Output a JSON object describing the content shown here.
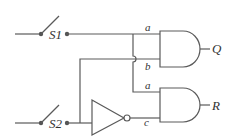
{
  "diagram": {
    "type": "logic-circuit",
    "switches": [
      {
        "id": "S1",
        "label": "S1"
      },
      {
        "id": "S2",
        "label": "S2"
      }
    ],
    "gates": [
      {
        "id": "and-upper",
        "type": "AND",
        "inputs": [
          "a",
          "b"
        ],
        "output": "Q"
      },
      {
        "id": "and-lower",
        "type": "AND",
        "inputs": [
          "a",
          "c"
        ],
        "output": "R"
      },
      {
        "id": "inverter",
        "type": "NOT",
        "output": "c"
      }
    ],
    "labels": {
      "s1": "S1",
      "s2": "S2",
      "upper_a": "a",
      "upper_b": "b",
      "lower_a": "a",
      "lower_c": "c",
      "out_q": "Q",
      "out_r": "R"
    }
  }
}
